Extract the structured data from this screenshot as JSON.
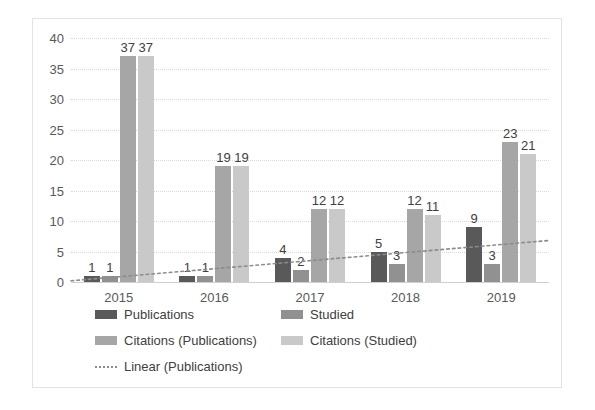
{
  "chart_data": {
    "type": "bar",
    "title": "",
    "xlabel": "",
    "ylabel": "",
    "categories": [
      "2015",
      "2016",
      "2017",
      "2018",
      "2019"
    ],
    "ylim": [
      0,
      40
    ],
    "ytick_step": 5,
    "yticks": [
      "40",
      "35",
      "30",
      "25",
      "20",
      "15",
      "10",
      "5",
      "0"
    ],
    "grid": true,
    "legend_position": "bottom",
    "series": [
      {
        "name": "Publications",
        "color": "#595959",
        "values": [
          1,
          1,
          4,
          5,
          9
        ]
      },
      {
        "name": "Studied",
        "color": "#919191",
        "values": [
          1,
          1,
          2,
          3,
          3
        ]
      },
      {
        "name": "Citations (Publications)",
        "color": "#a6a6a6",
        "values": [
          37,
          19,
          12,
          12,
          23
        ]
      },
      {
        "name": "Citations (Studied)",
        "color": "#c9c9c9",
        "values": [
          37,
          19,
          12,
          11,
          21
        ]
      }
    ],
    "trendline": {
      "name": "Linear (Publications)",
      "style": "dotted",
      "color": "#8c8c8c",
      "start_value": 0.2,
      "end_value": 6.8
    }
  },
  "legend": {
    "rows": [
      [
        {
          "label": "Publications",
          "swatch": "s0"
        },
        {
          "label": "Studied",
          "swatch": "s1"
        }
      ],
      [
        {
          "label": "Citations (Publications)",
          "swatch": "s2"
        },
        {
          "label": "Citations (Studied)",
          "swatch": "s3"
        }
      ],
      [
        {
          "label": "Linear (Publications)",
          "swatch": "line"
        }
      ]
    ]
  }
}
